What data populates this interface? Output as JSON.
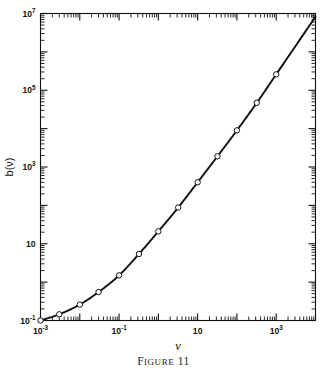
{
  "figure": {
    "caption_first_letter": "F",
    "caption_rest": "IGURE",
    "caption_number": "11",
    "caption_full": "FIGURE 11"
  },
  "chart_data": {
    "type": "line",
    "title": "",
    "xlabel": "ν",
    "ylabel": "b(ν)",
    "xscale": "log",
    "yscale": "log",
    "xlim": [
      0.001,
      10000
    ],
    "ylim": [
      0.1,
      10000000
    ],
    "grid": false,
    "legend": null,
    "marker": "open-circle",
    "line_color": "#111111",
    "marker_face_color": "#ffffff",
    "marker_edge_color": "#111111",
    "x_tick_labels": [
      {
        "value": 0.001,
        "text": "10⁻³",
        "mantissa": "10",
        "exponent": "-3"
      },
      {
        "value": 0.1,
        "text": "10⁻¹",
        "mantissa": "10",
        "exponent": "-1"
      },
      {
        "value": 10,
        "text": "10",
        "mantissa": "10",
        "exponent": ""
      },
      {
        "value": 1000,
        "text": "10³",
        "mantissa": "10",
        "exponent": "3"
      }
    ],
    "y_tick_labels": [
      {
        "value": 0.1,
        "text": "10⁻¹",
        "mantissa": "10",
        "exponent": "-1"
      },
      {
        "value": 10,
        "text": "10",
        "mantissa": "10",
        "exponent": ""
      },
      {
        "value": 1000,
        "text": "10³",
        "mantissa": "10",
        "exponent": "3"
      },
      {
        "value": 100000,
        "text": "10⁵",
        "mantissa": "10",
        "exponent": "5"
      },
      {
        "value": 10000000,
        "text": "10⁷",
        "mantissa": "10",
        "exponent": "7"
      }
    ],
    "x": [
      0.001,
      0.003,
      0.01,
      0.03,
      0.1,
      0.32,
      1.0,
      3.2,
      10,
      32,
      100,
      320,
      1000
    ],
    "y": [
      0.1,
      0.145,
      0.26,
      0.55,
      1.5,
      5.4,
      21,
      88,
      400,
      1900,
      9000,
      47000,
      260000
    ],
    "points": [
      {
        "x": 0.001,
        "y": 0.1
      },
      {
        "x": 0.003,
        "y": 0.145
      },
      {
        "x": 0.01,
        "y": 0.26
      },
      {
        "x": 0.03,
        "y": 0.55
      },
      {
        "x": 0.1,
        "y": 1.5
      },
      {
        "x": 0.32,
        "y": 5.4
      },
      {
        "x": 1.0,
        "y": 21
      },
      {
        "x": 3.2,
        "y": 88
      },
      {
        "x": 10,
        "y": 400
      },
      {
        "x": 32,
        "y": 1900
      },
      {
        "x": 100,
        "y": 9000
      },
      {
        "x": 320,
        "y": 47000
      },
      {
        "x": 1000,
        "y": 260000
      }
    ]
  }
}
